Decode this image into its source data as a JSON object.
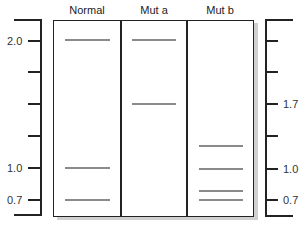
{
  "lanes": [
    {
      "label": "Normal",
      "bands": [
        2.0,
        1.0,
        0.7
      ]
    },
    {
      "label": "Mut a",
      "bands": [
        2.0,
        1.7
      ]
    },
    {
      "label": "Mut b",
      "bands": [
        1.3,
        1.0,
        0.8,
        0.7
      ]
    }
  ],
  "left_axis": {
    "labels": [
      "2.0",
      "1.0",
      "0.7"
    ]
  },
  "right_axis": {
    "labels": [
      "1.7",
      "1.0",
      "0.7"
    ]
  },
  "colors": {
    "band": "#8a8a8a",
    "line": "#222222",
    "shadow": "#d0d0d0"
  }
}
